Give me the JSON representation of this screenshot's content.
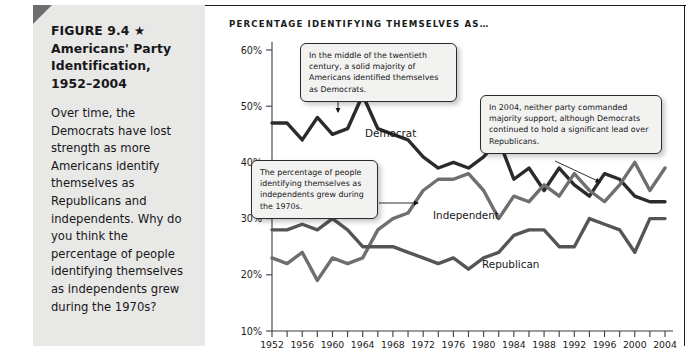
{
  "figure": {
    "title": "FIGURE 9.4 ★ Americans' Party Identification, 1952–2004",
    "title_lines": [
      "FIGURE 9.4 ★",
      "Americans' Party",
      "Identification,",
      "1952–2004"
    ],
    "description": "Over time, the Democrats have lost strength as more Americans identify themselves as Republicans and independents. Why do you think the percentage of people identifying themselves as independents grew during the 1970s?"
  },
  "chart_heading": "PERCENTAGE IDENTIFYING THEMSELVES AS…",
  "callouts": [
    {
      "id": "democrat",
      "text": "In the middle of the twentieth century, a solid majority of Americans identified themselves as Democrats."
    },
    {
      "id": "independent",
      "text": "The percentage of people identifying themselves as independents grew during the 1970s."
    },
    {
      "id": "year2004",
      "text": "In 2004, neither party commanded majority support, although Democrats continued to hold a significant lead over Republicans."
    }
  ],
  "colors": {
    "democrat": "#2b2b2b",
    "independent": "#6f6f6f",
    "republican": "#555555",
    "panel_background": "#e8e8e6",
    "axis": "#3d3d3d",
    "callout_background": "#f2f2f0"
  },
  "chart_data": {
    "type": "line",
    "title": "PERCENTAGE IDENTIFYING THEMSELVES AS…",
    "xlabel": "",
    "ylabel": "",
    "xlim": [
      1952,
      2004
    ],
    "ylim": [
      10,
      60
    ],
    "grid": false,
    "legend": "inline-labels",
    "ytick_labels": [
      "10%",
      "20%",
      "30%",
      "40%",
      "50%",
      "60%"
    ],
    "ytick_values": [
      10,
      20,
      30,
      40,
      50,
      60
    ],
    "xtick_labels": [
      "1952",
      "1956",
      "1960",
      "1964",
      "1968",
      "1972",
      "1976",
      "1980",
      "1984",
      "1988",
      "1992",
      "1996",
      "2000",
      "2004"
    ],
    "xtick_values": [
      1952,
      1956,
      1960,
      1964,
      1968,
      1972,
      1976,
      1980,
      1984,
      1988,
      1992,
      1996,
      2000,
      2004
    ],
    "minor_xtick_interval": 2,
    "x": [
      1952,
      1954,
      1956,
      1958,
      1960,
      1962,
      1964,
      1966,
      1968,
      1970,
      1972,
      1974,
      1976,
      1978,
      1980,
      1982,
      1984,
      1986,
      1988,
      1990,
      1992,
      1994,
      1996,
      1998,
      2000,
      2002,
      2004
    ],
    "series": [
      {
        "name": "Democrat",
        "color": "#2b2b2b",
        "values": [
          47,
          47,
          44,
          48,
          45,
          46,
          52,
          46,
          45,
          44,
          41,
          39,
          40,
          39,
          41,
          44,
          37,
          39,
          35,
          39,
          36,
          34,
          38,
          37,
          34,
          33,
          33
        ]
      },
      {
        "name": "Independent",
        "color": "#6f6f6f",
        "values": [
          23,
          22,
          24,
          19,
          23,
          22,
          23,
          28,
          30,
          31,
          35,
          37,
          37,
          38,
          35,
          30,
          34,
          33,
          36,
          34,
          38,
          35,
          33,
          36,
          40,
          35,
          39
        ]
      },
      {
        "name": "Republican",
        "color": "#555555",
        "values": [
          28,
          28,
          29,
          28,
          30,
          28,
          25,
          25,
          25,
          24,
          23,
          22,
          23,
          21,
          23,
          24,
          27,
          28,
          28,
          25,
          25,
          30,
          29,
          28,
          24,
          30,
          30
        ]
      }
    ],
    "annotations": [
      "In the middle of the twentieth century, a solid majority of Americans identified themselves as Democrats.",
      "The percentage of people identifying themselves as independents grew during the 1970s.",
      "In 2004, neither party commanded majority support, although Democrats continued to hold a significant lead over Republicans."
    ]
  }
}
